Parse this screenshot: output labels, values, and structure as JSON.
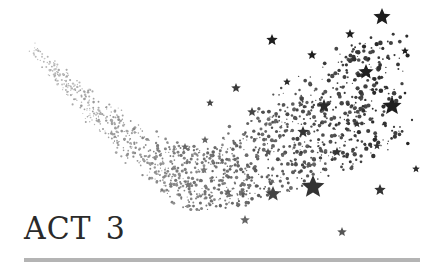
{
  "title": {
    "label": "ACT",
    "number": "3"
  },
  "colors": {
    "star_dark": "#1e1e1e",
    "star_mid": "#5a5a5a",
    "dust_light": "#9a9a9a",
    "rule": "#b4b4b4",
    "text": "#2a2a2a"
  },
  "big_stars": [
    {
      "x": 382,
      "y": 17,
      "r": 9,
      "c": "#1e1e1e"
    },
    {
      "x": 272,
      "y": 40,
      "r": 6,
      "c": "#1e1e1e"
    },
    {
      "x": 350,
      "y": 34,
      "r": 5,
      "c": "#1e1e1e"
    },
    {
      "x": 405,
      "y": 51,
      "r": 4,
      "c": "#1e1e1e"
    },
    {
      "x": 312,
      "y": 55,
      "r": 5,
      "c": "#1e1e1e"
    },
    {
      "x": 366,
      "y": 72,
      "r": 8,
      "c": "#1e1e1e"
    },
    {
      "x": 392,
      "y": 106,
      "r": 10,
      "c": "#1e1e1e"
    },
    {
      "x": 324,
      "y": 106,
      "r": 7,
      "c": "#2a2a2a"
    },
    {
      "x": 287,
      "y": 82,
      "r": 4,
      "c": "#2a2a2a"
    },
    {
      "x": 236,
      "y": 88,
      "r": 5,
      "c": "#3a3a3a"
    },
    {
      "x": 303,
      "y": 132,
      "r": 6,
      "c": "#333333"
    },
    {
      "x": 357,
      "y": 124,
      "r": 4,
      "c": "#333333"
    },
    {
      "x": 337,
      "y": 152,
      "r": 5,
      "c": "#333333"
    },
    {
      "x": 377,
      "y": 146,
      "r": 4,
      "c": "#333333"
    },
    {
      "x": 416,
      "y": 169,
      "r": 4,
      "c": "#2a2a2a"
    },
    {
      "x": 313,
      "y": 187,
      "r": 12,
      "c": "#333333"
    },
    {
      "x": 273,
      "y": 194,
      "r": 8,
      "c": "#444444"
    },
    {
      "x": 380,
      "y": 190,
      "r": 6,
      "c": "#333333"
    },
    {
      "x": 245,
      "y": 220,
      "r": 5,
      "c": "#666666"
    },
    {
      "x": 342,
      "y": 232,
      "r": 5,
      "c": "#555555"
    },
    {
      "x": 228,
      "y": 192,
      "r": 4,
      "c": "#666666"
    },
    {
      "x": 185,
      "y": 147,
      "r": 4,
      "c": "#666666"
    },
    {
      "x": 205,
      "y": 140,
      "r": 4,
      "c": "#666666"
    },
    {
      "x": 188,
      "y": 185,
      "r": 4,
      "c": "#777777"
    },
    {
      "x": 210,
      "y": 103,
      "r": 4,
      "c": "#444444"
    },
    {
      "x": 252,
      "y": 112,
      "r": 5,
      "c": "#444444"
    },
    {
      "x": 268,
      "y": 152,
      "r": 4,
      "c": "#555555"
    },
    {
      "x": 204,
      "y": 170,
      "r": 4,
      "c": "#777777"
    }
  ]
}
